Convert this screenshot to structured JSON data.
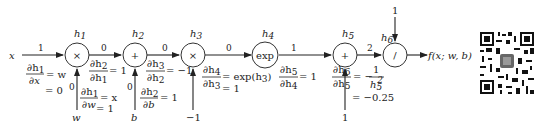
{
  "diagram": {
    "input_x": "x",
    "output": "f(x; w, b)",
    "nodes": [
      {
        "id": "h1",
        "label": "h",
        "sub": "1",
        "op": "×"
      },
      {
        "id": "h2",
        "label": "h",
        "sub": "2",
        "op": "+"
      },
      {
        "id": "h3",
        "label": "h",
        "sub": "3",
        "op": "×"
      },
      {
        "id": "h4",
        "label": "h",
        "sub": "4",
        "op": "exp"
      },
      {
        "id": "h5",
        "label": "h",
        "sub": "5",
        "op": "+"
      },
      {
        "id": "h6",
        "label": "h",
        "sub": "6",
        "op": "/"
      }
    ],
    "edges_forward": [
      {
        "from": "x",
        "to": "h1",
        "value": "1"
      },
      {
        "from": "h1",
        "to": "h2",
        "value": "0"
      },
      {
        "from": "h2",
        "to": "h3",
        "value": "0"
      },
      {
        "from": "h3",
        "to": "h4",
        "value": "0"
      },
      {
        "from": "h4",
        "to": "h5",
        "value": "1"
      },
      {
        "from": "h5",
        "to": "h6",
        "value": "2"
      },
      {
        "from": "w",
        "to": "h1",
        "value": "0"
      },
      {
        "from": "b",
        "to": "h2",
        "value": "0"
      }
    ],
    "side_inputs": [
      {
        "label": "w",
        "to": "h1"
      },
      {
        "label": "b",
        "to": "h2"
      },
      {
        "label": "−1",
        "to": "h3"
      },
      {
        "label": "1",
        "to": "h5"
      },
      {
        "label": "1",
        "to": "h6"
      }
    ],
    "derivatives": [
      {
        "num": "∂h₁",
        "den": "∂x",
        "expr": "= w",
        "value": "= 0"
      },
      {
        "num": "∂h₁",
        "den": "∂w",
        "expr": "= x",
        "value": "= 1"
      },
      {
        "num": "∂h₂",
        "den": "∂h₁",
        "expr": "= 1",
        "value": ""
      },
      {
        "num": "∂h₂",
        "den": "∂b",
        "expr": "= 1",
        "value": ""
      },
      {
        "num": "∂h₃",
        "den": "∂h₂",
        "expr": "= −1",
        "value": ""
      },
      {
        "num": "∂h₄",
        "den": "∂h₃",
        "expr": "= exp(h₃)",
        "value": "= 1"
      },
      {
        "num": "∂h₅",
        "den": "∂h₄",
        "expr": "= 1",
        "value": ""
      },
      {
        "num": "∂h₆",
        "den": "∂h₅",
        "expr": "= −1/h₅²",
        "value": "= −0.25"
      }
    ]
  },
  "labels": {
    "x": "x",
    "w": "w",
    "b": "b",
    "neg1": "−1",
    "one5": "1",
    "one6": "1",
    "out": "f(x; w, b)",
    "e_x": "1",
    "e_12": "0",
    "e_23": "0",
    "e_34": "0",
    "e_45": "1",
    "e_56": "2",
    "e_w": "0",
    "e_b": "0",
    "op1": "×",
    "op2": "+",
    "op3": "×",
    "op4": "exp",
    "op5": "+",
    "op6": "/",
    "h": "h",
    "s1": "1",
    "s2": "2",
    "s3": "3",
    "s4": "4",
    "s5": "5",
    "s6": "6",
    "d1n": "∂h",
    "d1ns": "1",
    "d1d": "∂x",
    "d1e": "= w",
    "d1v": "= 0",
    "dwn": "∂h",
    "dwns": "1",
    "dwd": "∂w",
    "dwe": "= x",
    "dwv": "= 1",
    "d2n": "∂h",
    "d2ns": "2",
    "d2d": "∂h",
    "d2ds": "1",
    "d2e": "= 1",
    "dbn": "∂h",
    "dbns": "2",
    "dbd": "∂b",
    "dbe": "= 1",
    "d3n": "∂h",
    "d3ns": "3",
    "d3d": "∂h",
    "d3ds": "2",
    "d3e": "= −1",
    "d4n": "∂h",
    "d4ns": "4",
    "d4d": "∂h",
    "d4ds": "3",
    "d4e": "= exp(h",
    "d4es": "3",
    "d4ec": ")",
    "d4v": "= 1",
    "d5n": "∂h",
    "d5ns": "5",
    "d5d": "∂h",
    "d5ds": "4",
    "d5e": "= 1",
    "d6n": "∂h",
    "d6ns": "6",
    "d6d": "∂h",
    "d6ds": "5",
    "d6e": "= −",
    "d6fn": "1",
    "d6fd": "h",
    "d6fds": "5",
    "d6fsup": "2",
    "d6v": "= −0.25"
  },
  "qr_code": {
    "description": "qr-code"
  }
}
